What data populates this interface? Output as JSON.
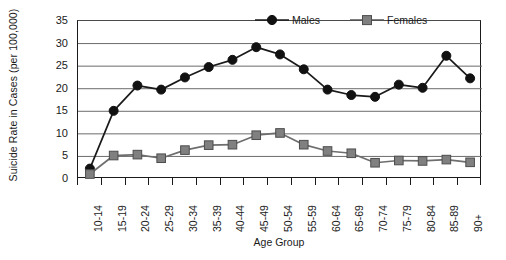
{
  "chart_data": {
    "type": "line",
    "title": "",
    "xlabel": "Age Group",
    "ylabel": "Suicide Rate in Cases (per 100,000)",
    "ylim": [
      0,
      35
    ],
    "ytick_step": 5,
    "yticks": [
      35,
      30,
      25,
      20,
      15,
      10,
      5,
      0
    ],
    "grid": "horizontal",
    "legend_position": "top-right-inside",
    "categories": [
      "10-14",
      "15-19",
      "20-24",
      "25-29",
      "30-34",
      "35-39",
      "40-44",
      "45-49",
      "50-54",
      "55-59",
      "60-64",
      "65-69",
      "70-74",
      "75-79",
      "80-84",
      "85-89",
      "90+"
    ],
    "series": [
      {
        "name": "Males",
        "color": "#1a1a1a",
        "marker": "circle",
        "values": [
          2.3,
          15.1,
          20.7,
          19.8,
          22.5,
          24.8,
          26.4,
          29.2,
          27.6,
          24.3,
          19.8,
          18.6,
          18.2,
          20.9,
          20.2,
          27.3,
          22.3
        ]
      },
      {
        "name": "Females",
        "color": "#808080",
        "marker": "square",
        "values": [
          1.1,
          5.2,
          5.4,
          4.6,
          6.4,
          7.5,
          7.6,
          9.7,
          10.2,
          7.6,
          6.2,
          5.7,
          3.6,
          4.1,
          4.0,
          4.3,
          3.7
        ]
      }
    ]
  },
  "legend": {
    "items": [
      {
        "label": "Males",
        "marker_icon": "circle-marker-icon",
        "color": "#1a1a1a"
      },
      {
        "label": "Females",
        "marker_icon": "square-marker-icon",
        "color": "#808080"
      }
    ]
  },
  "axes": {
    "y_title": "Suicide Rate in Cases (per 100,000)",
    "x_title": "Age Group"
  }
}
